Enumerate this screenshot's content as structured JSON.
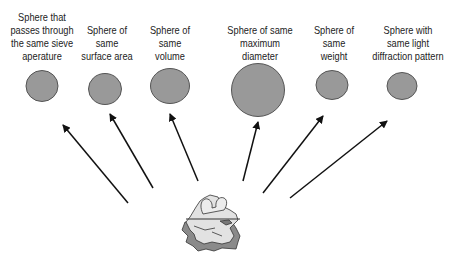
{
  "labels": [
    {
      "lines": [
        "Sphere that",
        "passes through",
        "the same sieve",
        "aperature"
      ]
    },
    {
      "lines": [
        "Sphere of",
        "same",
        "surface area"
      ]
    },
    {
      "lines": [
        "Sphere of",
        "same",
        "volume"
      ]
    },
    {
      "lines": [
        "Sphere of same",
        "maximum",
        "diameter"
      ]
    },
    {
      "lines": [
        "Sphere of",
        "same",
        "weight"
      ]
    },
    {
      "lines": [
        "Sphere with",
        "same light",
        "diffraction pattern"
      ]
    }
  ],
  "colors": {
    "sphere_fill": "#999999",
    "sphere_stroke": "#555555",
    "arrow": "#111111",
    "particle_light": "#e2e2e2",
    "particle_dark": "#8a8a8a"
  },
  "icons": {
    "particle": "irregular-particle-icon"
  }
}
